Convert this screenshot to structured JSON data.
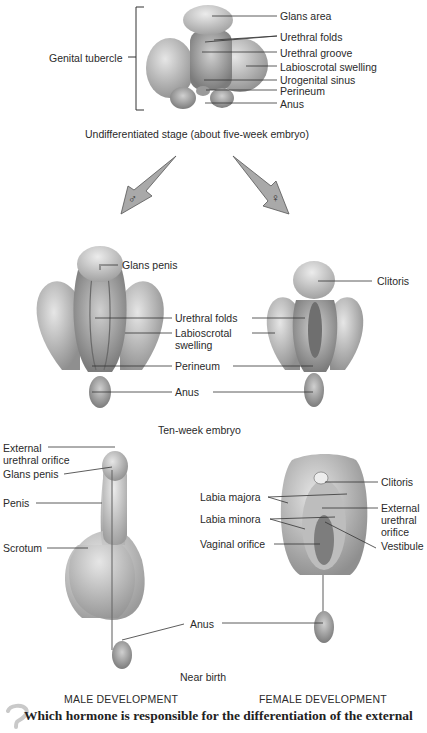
{
  "stage1": {
    "bracket_label": "Genital tubercle",
    "labels": [
      "Glans area",
      "Urethral folds",
      "Urethral groove",
      "Labioscrotal swelling",
      "Urogenital sinus",
      "Perineum",
      "Anus"
    ],
    "caption": "Undifferentiated stage (about five-week embryo)"
  },
  "arrows": {
    "male_symbol": "♂",
    "female_symbol": "♀",
    "fill": "#a9a9a9"
  },
  "stage2": {
    "male_labels": {
      "glans": "Glans penis"
    },
    "shared_labels": {
      "urethral_folds": "Urethral folds",
      "labioscrotal_1": "Labioscrotal",
      "labioscrotal_2": "swelling",
      "perineum": "Perineum",
      "anus": "Anus"
    },
    "female_labels": {
      "clitoris": "Clitoris"
    },
    "caption": "Ten-week embryo"
  },
  "stage3": {
    "male_labels": {
      "ext_1": "External",
      "ext_2": "urethral orifice",
      "glans": "Glans penis",
      "penis": "Penis",
      "scrotum": "Scrotum"
    },
    "female_labels": {
      "clitoris": "Clitoris",
      "labia_majora": "Labia majora",
      "labia_minora": "Labia minora",
      "vaginal": "Vaginal orifice",
      "ext_1": "External",
      "ext_2": "urethral",
      "ext_3": "orifice",
      "vestibule": "Vestibule"
    },
    "shared_labels": {
      "anus": "Anus"
    },
    "caption": "Near birth"
  },
  "sections": {
    "male": "MALE DEVELOPMENT",
    "female": "FEMALE DEVELOPMENT"
  },
  "question": {
    "text": "Which hormone is responsible for the differentiation of the external"
  },
  "colors": {
    "tissue": "#b8b8b8",
    "tissue_light": "#dcdcdc",
    "tissue_dark": "#8e8e8e",
    "line": "#333333"
  }
}
